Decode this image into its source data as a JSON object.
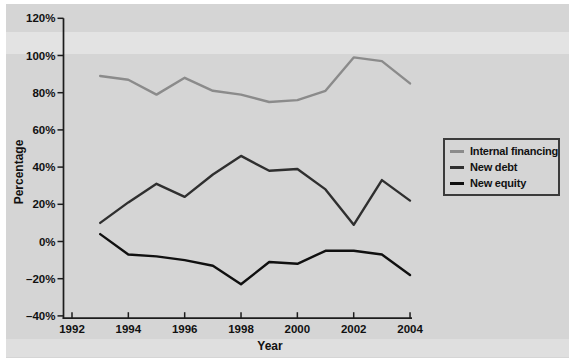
{
  "figure": {
    "background_color": "#ffffff",
    "panel_color": "#d5d5d5"
  },
  "chart_data": {
    "type": "line",
    "title": "",
    "xlabel": "Year",
    "ylabel": "Percentage",
    "x": [
      1993,
      1994,
      1995,
      1996,
      1997,
      1998,
      1999,
      2000,
      2001,
      2002,
      2003,
      2004
    ],
    "series": [
      {
        "name": "Internal financing",
        "color": "#8b8b8b",
        "values": [
          89,
          87,
          79,
          88,
          81,
          79,
          75,
          76,
          81,
          99,
          97,
          85
        ]
      },
      {
        "name": "New debt",
        "color": "#2f2f2f",
        "values": [
          10,
          21,
          31,
          24,
          36,
          46,
          38,
          39,
          28,
          9,
          33,
          22
        ]
      },
      {
        "name": "New equity",
        "color": "#101010",
        "values": [
          4,
          -7,
          -8,
          -10,
          -13,
          -23,
          -11,
          -12,
          -5,
          -5,
          -7,
          -18
        ]
      }
    ],
    "xlim": [
      1992,
      2004.3
    ],
    "ylim": [
      -40,
      120
    ],
    "x_tick_values": [
      1992,
      1994,
      1996,
      1998,
      2000,
      2002,
      2004
    ],
    "x_tick_labels": [
      "1992",
      "1994",
      "1996",
      "1998",
      "2000",
      "2002",
      "2004"
    ],
    "y_tick_values": [
      -40,
      -20,
      0,
      20,
      40,
      60,
      80,
      100,
      120
    ],
    "y_tick_labels": [
      "–40%",
      "–20%",
      "0%",
      "20%",
      "40%",
      "60%",
      "80%",
      "100%",
      "120%"
    ],
    "grid": false,
    "legend_position": "right",
    "legend_entries": [
      "Internal financing",
      "New debt",
      "New equity"
    ],
    "axis_color": "#1c1c1c",
    "text_color": "#111111"
  }
}
